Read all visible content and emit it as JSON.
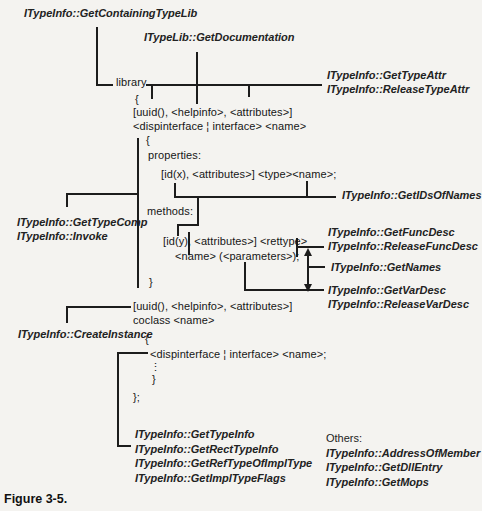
{
  "figure": {
    "caption": "Figure 3-5."
  },
  "interface_labels": {
    "get_containing_type_lib": "ITypeInfo::GetContainingTypeLib",
    "get_documentation": "ITypeLib::GetDocumentation",
    "get_type_attr": "ITypeInfo::GetTypeAttr",
    "release_type_attr": "ITypeInfo::ReleaseTypeAttr",
    "get_ids_of_names": "ITypeInfo::GetIDsOfNames",
    "get_type_comp": "ITypeInfo::GetTypeComp",
    "invoke": "ITypeInfo::Invoke",
    "get_func_desc": "ITypeInfo::GetFuncDesc",
    "release_func_desc": "ITypeInfo::ReleaseFuncDesc",
    "get_names": "ITypeInfo::GetNames",
    "get_var_desc": "ITypeInfo::GetVarDesc",
    "release_var_desc": "ITypeInfo::ReleaseVarDesc",
    "create_instance": "ITypeInfo::CreateInstance",
    "get_type_info": "ITypeInfo::GetTypeInfo",
    "get_rect_type_info": "ITypeInfo::GetRectTypeInfo",
    "get_ref_type_of_impl_type": "ITypeInfo::GetRefTypeOfImplType",
    "get_impl_type_flags": "ITypeInfo::GetImplTypeFlags",
    "others_heading": "Others:",
    "address_of_member": "ITypeInfo::AddressOfMember",
    "get_dll_entry": "ITypeInfo::GetDllEntry",
    "get_mops": "ITypeInfo::GetMops"
  },
  "odl_code": {
    "library_kw": "library",
    "open_brace_library": "{",
    "uuid_attributes_line_1": "[uuid(), <helpinfo>, <attributes>]",
    "dispinterface_line_1": "<dispinterface ¦ interface> <name>",
    "open_brace_interface": "{",
    "properties_kw": "properties:",
    "id_x_line": "[id(x), <attributes>] <type><name>;",
    "methods_kw": "methods:",
    "id_y_line": "[id(y), <attributes>] <rettype>",
    "name_params_line": "<name> (<parameters>);",
    "close_brace_interface": "}",
    "uuid_attributes_line_2": "[uuid(), <helpinfo>, <attributes>]",
    "coclass_line": "coclass <name>",
    "open_brace_coclass": "{",
    "dispinterface_line_2": "<dispinterface ¦ interface> <name>;",
    "vertical_ellipsis": "⋮",
    "close_brace_coclass": "}",
    "close_brace_library": "};"
  }
}
